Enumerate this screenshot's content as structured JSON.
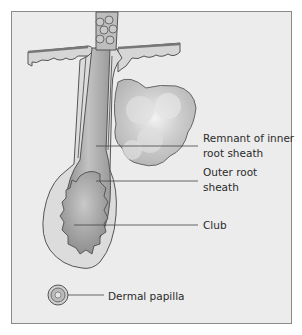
{
  "figure": {
    "type": "hair follicle (catagen/telogen club hair) cross-section illustration",
    "labels": [
      {
        "id": "remnant",
        "lines": [
          "Remnant of inner",
          "root sheath"
        ]
      },
      {
        "id": "outer",
        "lines": [
          "Outer root",
          "sheath"
        ]
      },
      {
        "id": "club",
        "lines": [
          "Club"
        ]
      },
      {
        "id": "papilla",
        "lines": [
          "Dermal papilla"
        ]
      }
    ]
  },
  "colors": {
    "background": "#ececec",
    "frame_border": "#8a8a8a",
    "outline": "#555555",
    "follicle_fill": "#dcdcdc",
    "shaft_fill": "#a8a8a8",
    "gland_fill": "#c4c4c4",
    "leader_line": "#444444",
    "label_text": "#2a2a2a"
  }
}
